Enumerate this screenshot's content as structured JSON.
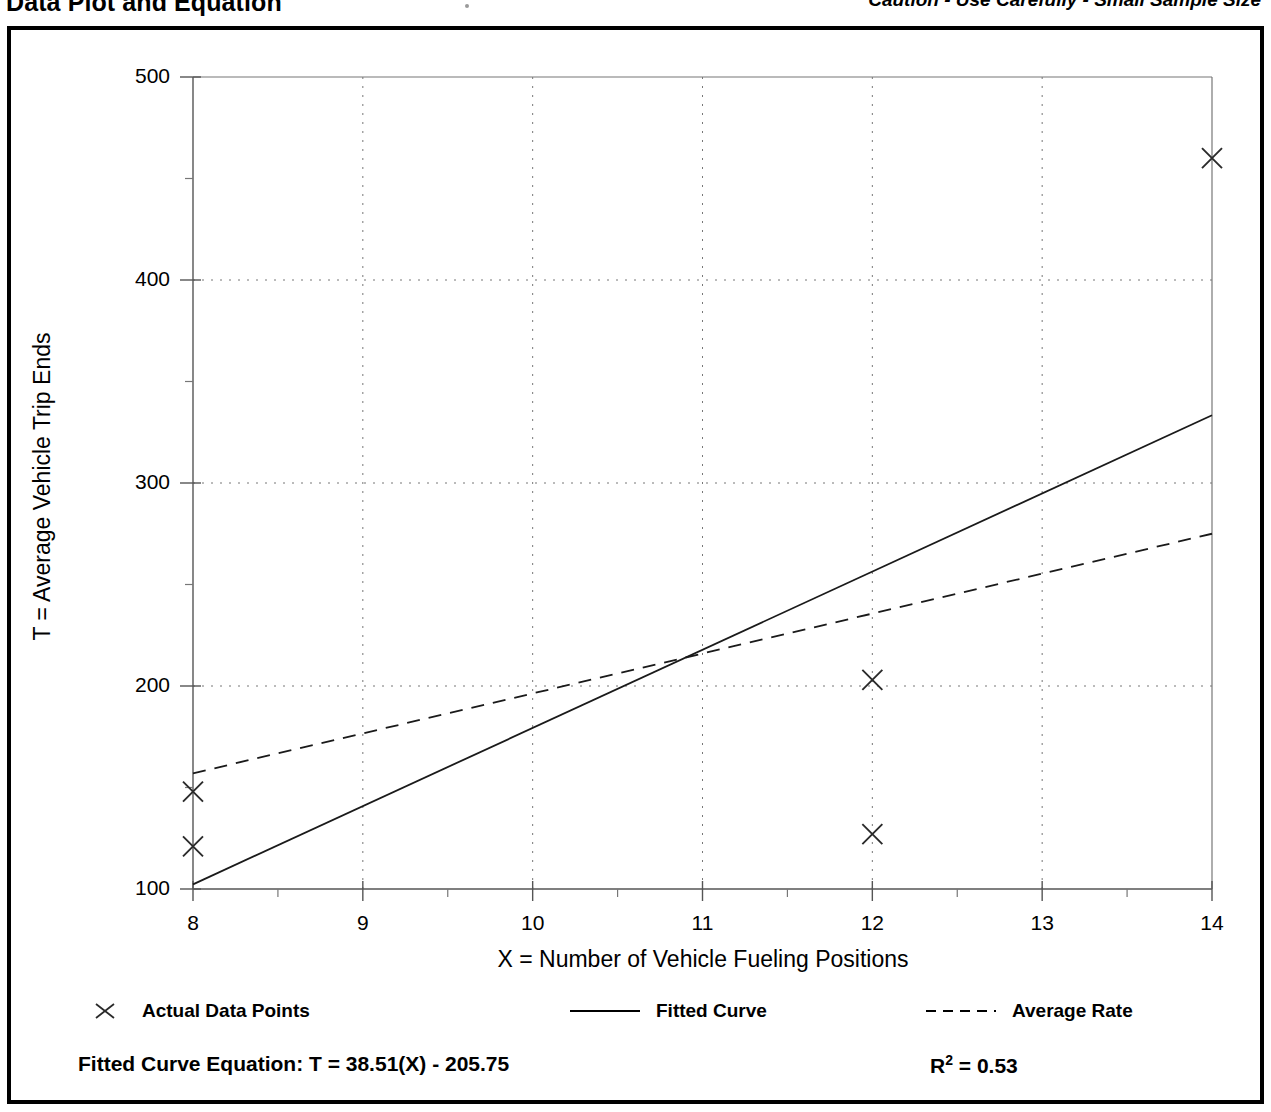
{
  "header": {
    "title": "Data Plot and Equation",
    "caution": "Caution - Use Carefully - Small Sample Size"
  },
  "footer": {
    "equation_label": "Fitted Curve Equation:",
    "equation": "T = 38.51(X) - 205.75",
    "equation_full": "Fitted Curve Equation:  T = 38.51(X) - 205.75",
    "r2_prefix": "R",
    "r2_sup": "2",
    "r2_value": "= 0.53",
    "r2_full": "R2 = 0.53"
  },
  "legend": {
    "items": [
      {
        "label": "Actual Data Points",
        "style": "marker-x"
      },
      {
        "label": "Fitted Curve",
        "style": "solid-line"
      },
      {
        "label": "Average Rate",
        "style": "dashed-line"
      }
    ]
  },
  "chart_data": {
    "type": "scatter",
    "title": "Data Plot and Equation",
    "xlabel": "X = Number of Vehicle Fueling Positions",
    "ylabel": "T = Average Vehicle Trip Ends",
    "xlim": [
      8,
      14
    ],
    "ylim": [
      100,
      500
    ],
    "xticks": [
      8,
      9,
      10,
      11,
      12,
      13,
      14
    ],
    "xtick_labels": [
      "8",
      "9",
      "10",
      "11",
      "12",
      "13",
      "14"
    ],
    "x_minor_ticks": [
      8.5,
      9.5,
      10.5,
      11.5,
      12.5,
      13.5
    ],
    "yticks": [
      100,
      200,
      300,
      400,
      500
    ],
    "ytick_labels": [
      "100",
      "200",
      "300",
      "400",
      "500"
    ],
    "y_minor_ticks": [
      150,
      250,
      350,
      450
    ],
    "grid": true,
    "grid_style": "dotted",
    "legend_position": "below-axes",
    "series": [
      {
        "name": "Actual Data Points",
        "type": "scatter",
        "marker": "x",
        "points": [
          {
            "x": 8,
            "y": 148
          },
          {
            "x": 8,
            "y": 121
          },
          {
            "x": 12,
            "y": 203
          },
          {
            "x": 12,
            "y": 127
          },
          {
            "x": 14,
            "y": 460
          }
        ]
      },
      {
        "name": "Fitted Curve",
        "type": "line",
        "style": "solid",
        "equation": "T = 38.51(X) - 205.75",
        "r_squared": 0.53,
        "endpoints": [
          {
            "x": 8,
            "y": 102.3
          },
          {
            "x": 14,
            "y": 333.4
          }
        ]
      },
      {
        "name": "Average Rate",
        "type": "line",
        "style": "dashed",
        "endpoints": [
          {
            "x": 8,
            "y": 157
          },
          {
            "x": 14,
            "y": 275
          }
        ]
      }
    ]
  }
}
